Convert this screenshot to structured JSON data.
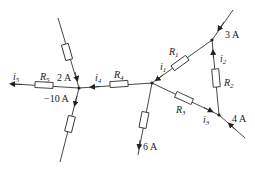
{
  "diagram": {
    "type": "circuit",
    "labels": {
      "i5": {
        "base": "i",
        "sub": "5"
      },
      "R5": {
        "base": "R",
        "sub": "5"
      },
      "left_top_current": "2 A",
      "left_bottom_current": "−10 A",
      "i4": {
        "base": "i",
        "sub": "4"
      },
      "R4": {
        "base": "R",
        "sub": "4"
      },
      "i1": {
        "base": "i",
        "sub": "1"
      },
      "R1": {
        "base": "R",
        "sub": "1"
      },
      "top_current": "3 A",
      "i2": {
        "base": "i",
        "sub": "2"
      },
      "R2": {
        "base": "R",
        "sub": "2"
      },
      "R3": {
        "base": "R",
        "sub": "3"
      },
      "i3": {
        "base": "i",
        "sub": "3"
      },
      "right_current": "4 A",
      "bottom_current": "6 A"
    }
  }
}
